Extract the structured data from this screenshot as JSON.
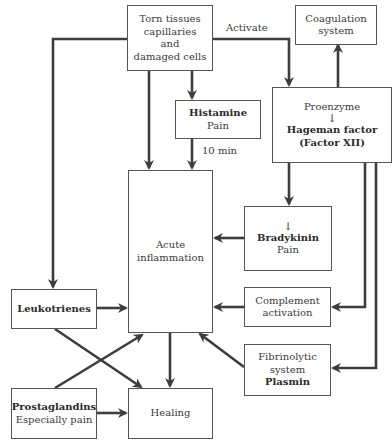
{
  "diagram": {
    "nodes": {
      "torn_tissues": {
        "lines": [
          "Torn tissues",
          "capillaries",
          "and",
          "damaged cells"
        ]
      },
      "coagulation": {
        "lines": [
          "Coagulation",
          "system"
        ]
      },
      "hageman": {
        "pre": "Proenzyme",
        "arrow": "↓",
        "bold1": "Hageman factor",
        "bold2": "(Factor XII)"
      },
      "histamine": {
        "bold": "Histamine",
        "sub": "Pain"
      },
      "acute": {
        "lines": [
          "Acute",
          "inflammation"
        ]
      },
      "bradykinin": {
        "arrow": "↓",
        "bold": "Bradykinin",
        "sub": "Pain"
      },
      "complement": {
        "lines": [
          "Complement",
          "activation"
        ]
      },
      "leukotrienes": {
        "bold": "Leukotrienes"
      },
      "fibrinolytic": {
        "lines": [
          "Fibrinolytic",
          "system"
        ],
        "bold": "Plasmin"
      },
      "prostaglandins": {
        "bold": "Prostaglandins",
        "sub": "Especially pain"
      },
      "healing": {
        "label": "Healing"
      }
    },
    "edge_labels": {
      "activate": "Activate",
      "ten_min": "10 min"
    },
    "edges": [
      {
        "from": "torn_tissues",
        "to": "hageman",
        "label": "Activate"
      },
      {
        "from": "torn_tissues",
        "to": "histamine"
      },
      {
        "from": "torn_tissues",
        "to": "acute"
      },
      {
        "from": "torn_tissues",
        "to": "leukotrienes"
      },
      {
        "from": "histamine",
        "to": "acute",
        "label": "10 min"
      },
      {
        "from": "hageman",
        "to": "coagulation"
      },
      {
        "from": "hageman",
        "to": "bradykinin"
      },
      {
        "from": "hageman",
        "to": "complement"
      },
      {
        "from": "hageman",
        "to": "fibrinolytic"
      },
      {
        "from": "bradykinin",
        "to": "acute"
      },
      {
        "from": "complement",
        "to": "acute"
      },
      {
        "from": "fibrinolytic",
        "to": "acute"
      },
      {
        "from": "leukotrienes",
        "to": "acute"
      },
      {
        "from": "leukotrienes",
        "to": "healing"
      },
      {
        "from": "prostaglandins",
        "to": "acute"
      },
      {
        "from": "prostaglandins",
        "to": "healing"
      },
      {
        "from": "acute",
        "to": "healing"
      }
    ],
    "colors": {
      "line": "#3d3d3d",
      "border": "#555555",
      "text": "#3a3a3a"
    }
  }
}
